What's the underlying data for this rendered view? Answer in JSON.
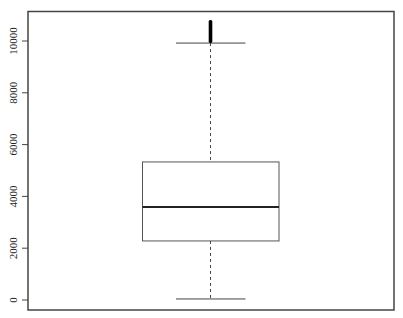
{
  "chart_data": {
    "type": "boxplot",
    "title": "",
    "xlabel": "",
    "ylabel": "",
    "ylim": [
      -400,
      11300
    ],
    "yticks": [
      0,
      2000,
      4000,
      6000,
      8000,
      10000
    ],
    "ytick_labels": [
      "0",
      "2000",
      "4000",
      "6000",
      "8000",
      "10000"
    ],
    "grid": false,
    "legend": null,
    "series": [
      {
        "name": "",
        "lower_whisker": 40,
        "q1": 2280,
        "median": 3590,
        "q3": 5330,
        "upper_whisker": 9920,
        "outliers_range": [
          9920,
          10810
        ]
      }
    ]
  },
  "colors": {
    "box_stroke": "#555555",
    "median": "#222222",
    "axis": "#444444",
    "outliers": "#000000"
  }
}
